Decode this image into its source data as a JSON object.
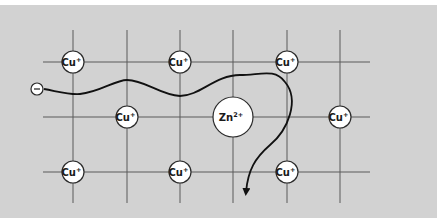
{
  "diagram": {
    "title": "",
    "background_color": "#d2d2d2",
    "lattice": {
      "vertical_lines_x": [
        73,
        127,
        180,
        233,
        287,
        340
      ],
      "vertical_line_span": [
        30,
        203
      ],
      "horizontal_lines_y": [
        62,
        117,
        172
      ],
      "horizontal_line_span": [
        43,
        370
      ]
    },
    "ions": [
      {
        "id": "cu-1",
        "element": "Cu",
        "charge": "+",
        "x": 73,
        "y": 62,
        "r": 11
      },
      {
        "id": "cu-2",
        "element": "Cu",
        "charge": "+",
        "x": 180,
        "y": 62,
        "r": 11
      },
      {
        "id": "cu-3",
        "element": "Cu",
        "charge": "+",
        "x": 287,
        "y": 62,
        "r": 11
      },
      {
        "id": "cu-4",
        "element": "Cu",
        "charge": "+",
        "x": 127,
        "y": 117,
        "r": 11
      },
      {
        "id": "zn-1",
        "element": "Zn",
        "charge": "2+",
        "x": 233,
        "y": 117,
        "r": 20
      },
      {
        "id": "cu-5",
        "element": "Cu",
        "charge": "+",
        "x": 340,
        "y": 117,
        "r": 11
      },
      {
        "id": "cu-6",
        "element": "Cu",
        "charge": "+",
        "x": 73,
        "y": 172,
        "r": 11
      },
      {
        "id": "cu-7",
        "element": "Cu",
        "charge": "+",
        "x": 180,
        "y": 172,
        "r": 11
      },
      {
        "id": "cu-8",
        "element": "Cu",
        "charge": "+",
        "x": 287,
        "y": 172,
        "r": 11
      }
    ],
    "electron": {
      "label": "−",
      "x": 37,
      "y": 89,
      "r": 6
    },
    "electron_path": {
      "description": "wavy electron trajectory scattered by Zn2+ impurity",
      "d": "M 44 89 C 60 92, 70 95, 80 94 C 100 92, 115 80, 127 80 C 145 80, 160 95, 180 96 C 200 96, 215 75, 240 75 C 260 75, 275 68, 285 82 C 300 100, 288 130, 270 145 C 255 158, 248 170, 246 192",
      "arrow_tip": {
        "x": 246,
        "y": 194
      }
    }
  }
}
